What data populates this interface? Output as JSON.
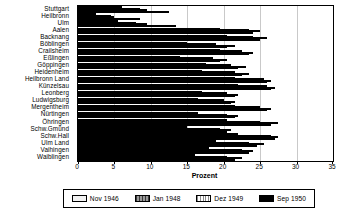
{
  "chart_data": {
    "type": "bar",
    "orientation": "horizontal",
    "title": "",
    "xlabel": "Prozent",
    "ylabel": "",
    "xlim": [
      0,
      35
    ],
    "xticks": [
      0,
      5,
      10,
      15,
      20,
      25,
      30,
      35
    ],
    "grid": true,
    "legend_position": "bottom",
    "categories": [
      "Stuttgart",
      "Heilbronn",
      "Ulm",
      "Aalen",
      "Backnang",
      "Böblingen",
      "Crailsheim",
      "Eßlingen",
      "Göppingen",
      "Heidenheim",
      "Heilbronn Land",
      "Künzelsau",
      "Leonberg",
      "Ludwigsburg",
      "Mergentheim",
      "Nürtingen",
      "Öhringen",
      "Schw.Gmünd",
      "Schw.Hall",
      "Ulm Land",
      "Vaihingen",
      "Waiblingen"
    ],
    "series": [
      {
        "name": "Nov 1946",
        "color": "#f2f2f2",
        "values": [
          6.0,
          2.5,
          5.5,
          19.5,
          20.5,
          15.0,
          19.5,
          14.0,
          17.5,
          17.0,
          21.5,
          22.0,
          17.0,
          16.5,
          21.5,
          16.5,
          20.5,
          15.0,
          22.0,
          19.0,
          18.0,
          16.0
        ]
      },
      {
        "name": "Jan 1948",
        "color": "#6e6e6e",
        "values": [
          8.5,
          4.5,
          8.0,
          23.5,
          24.0,
          19.0,
          22.5,
          18.5,
          21.0,
          21.5,
          25.5,
          26.0,
          20.5,
          20.0,
          25.0,
          20.5,
          25.0,
          19.5,
          26.5,
          23.5,
          22.5,
          20.5
        ]
      },
      {
        "name": "Dez 1949",
        "color": "#d0d0d0",
        "values": [
          9.5,
          5.0,
          9.5,
          25.0,
          26.0,
          21.5,
          24.0,
          20.5,
          23.0,
          23.5,
          26.5,
          27.0,
          22.0,
          21.5,
          26.5,
          22.0,
          27.5,
          21.0,
          27.5,
          25.5,
          24.0,
          22.5
        ]
      },
      {
        "name": "Sep 1950",
        "color": "#000000",
        "values": [
          12.5,
          8.5,
          13.5,
          24.0,
          25.0,
          20.5,
          23.5,
          19.5,
          22.0,
          22.5,
          26.0,
          26.5,
          21.5,
          21.0,
          26.0,
          21.5,
          26.5,
          20.5,
          27.0,
          24.5,
          23.5,
          21.5
        ]
      }
    ]
  },
  "axis": {
    "x_title": "Prozent"
  }
}
